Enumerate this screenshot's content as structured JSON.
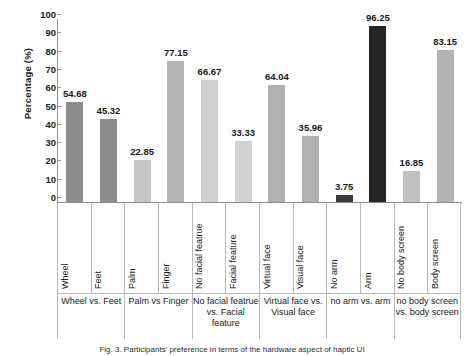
{
  "chart_data": {
    "type": "bar",
    "title": "",
    "xlabel": "",
    "ylabel": "Percentage (%)",
    "ylim": [
      0,
      100
    ],
    "ytick_labels": [
      "100",
      "90",
      "80",
      "70",
      "60",
      "50",
      "40",
      "30",
      "20",
      "10",
      "0"
    ],
    "ytick_values": [
      100,
      90,
      80,
      70,
      60,
      50,
      40,
      30,
      20,
      10,
      0
    ],
    "grid": false,
    "legend": "none",
    "categories": [
      "Wheel",
      "Feet",
      "Palm",
      "Finger",
      "No facial featrue",
      "Facial feature",
      "Virtual face",
      "Visual face",
      "No arm",
      "Arm",
      "No body screen",
      "Body screen"
    ],
    "values": [
      54.68,
      45.32,
      22.85,
      77.15,
      66.67,
      33.33,
      64.04,
      35.96,
      3.75,
      96.25,
      16.85,
      83.15
    ],
    "bar_colors": [
      "#8d8d8d",
      "#8d8d8d",
      "#c6c6c6",
      "#b5b5b5",
      "#cfcfcf",
      "#d2d2d2",
      "#b0b0b0",
      "#b0b0b0",
      "#3a3a3a",
      "#262626",
      "#c0c0c0",
      "#b3b3b3"
    ],
    "data_labels": [
      "54.68",
      "45.32",
      "22.85",
      "77.15",
      "66.67",
      "33.33",
      "64.04",
      "35.96",
      "3.75",
      "96.25",
      "16.85",
      "83.15"
    ],
    "groups": [
      {
        "label": "Wheel vs. Feet",
        "span": 2
      },
      {
        "label": "Palm vs Finger",
        "span": 2
      },
      {
        "label": "No facial featrue vs. Facial feature",
        "span": 2
      },
      {
        "label": "Virtual face vs. Visual face",
        "span": 2
      },
      {
        "label": "no arm vs. arm",
        "span": 2
      },
      {
        "label": "no body screen vs. body screen",
        "span": 2
      }
    ]
  },
  "caption": {
    "text": "Fig. 3. Participants' preference in terms of the hardware aspect of haptic UI"
  }
}
